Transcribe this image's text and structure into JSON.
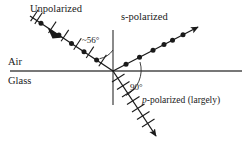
{
  "figure": {
    "type": "optics-ray-diagram",
    "labels": {
      "unpolarized": "Unpolarized",
      "s_polarized": "s-polarized",
      "p_polarized_prefix": "p",
      "p_polarized_rest": "-polarized (largely)",
      "medium_top": "Air",
      "medium_bottom": "Glass",
      "angle_incidence": "~56°",
      "angle_between_rays": "90°"
    },
    "colors": {
      "ink": "#1a1a1a",
      "line": "#3a3a3a",
      "background": "#ffffff"
    },
    "geometry": {
      "origin": [
        113,
        71
      ],
      "interface_y": 71,
      "interface_x_start": 10,
      "interface_x_end": 242,
      "normal_x": 113,
      "normal_y_top": 30,
      "normal_y_bottom": 105,
      "incident_start": [
        30,
        16
      ],
      "reflected_end": [
        202,
        23
      ],
      "refracted_end": [
        159,
        143
      ],
      "incidence_deg": 56,
      "separation_deg": 90
    },
    "markers": {
      "incident": "dots-and-ticks",
      "reflected": "dots",
      "refracted": "ticks"
    }
  }
}
